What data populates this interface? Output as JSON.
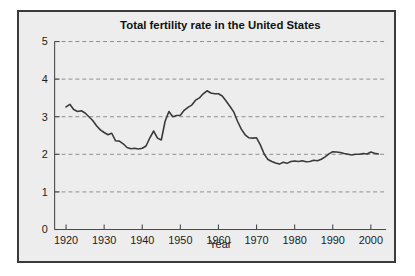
{
  "figure": {
    "background_color": "#ededed",
    "border_color": "#3b3b3b",
    "line_color": "#3a3a3a",
    "grid_color": "#8d8d8d"
  },
  "chart_data": {
    "type": "line",
    "title": "Total fertility rate in the United States",
    "xlabel": "Year",
    "ylabel": "",
    "xlim": [
      1917,
      2004
    ],
    "ylim": [
      0,
      5
    ],
    "grid": true,
    "legend": "none",
    "xticks": [
      1920,
      1930,
      1940,
      1950,
      1960,
      1970,
      1980,
      1990,
      2000
    ],
    "xtick_labels": [
      "1920",
      "1930",
      "1940",
      "1950",
      "1960",
      "1970",
      "1980",
      "1990",
      "2000"
    ],
    "yticks": [
      0,
      1,
      2,
      3,
      4,
      5
    ],
    "ytick_labels": [
      "0",
      "1",
      "2",
      "3",
      "4",
      "5"
    ],
    "series": [
      {
        "name": "Total fertility rate",
        "x": [
          1920,
          1921,
          1922,
          1923,
          1924,
          1925,
          1926,
          1927,
          1928,
          1929,
          1930,
          1931,
          1932,
          1933,
          1934,
          1935,
          1936,
          1937,
          1938,
          1939,
          1940,
          1941,
          1942,
          1943,
          1944,
          1945,
          1946,
          1947,
          1948,
          1949,
          1950,
          1951,
          1952,
          1953,
          1954,
          1955,
          1956,
          1957,
          1958,
          1959,
          1960,
          1961,
          1962,
          1963,
          1964,
          1965,
          1966,
          1967,
          1968,
          1969,
          1970,
          1971,
          1972,
          1973,
          1974,
          1975,
          1976,
          1977,
          1978,
          1979,
          1980,
          1981,
          1982,
          1983,
          1984,
          1985,
          1986,
          1987,
          1988,
          1989,
          1990,
          1991,
          1992,
          1993,
          1994,
          1995,
          1996,
          1997,
          1998,
          1999,
          2000,
          2001,
          2002
        ],
        "values": [
          3.26,
          3.33,
          3.19,
          3.14,
          3.16,
          3.1,
          3.0,
          2.9,
          2.76,
          2.65,
          2.58,
          2.52,
          2.56,
          2.36,
          2.35,
          2.28,
          2.18,
          2.15,
          2.16,
          2.14,
          2.16,
          2.22,
          2.44,
          2.62,
          2.43,
          2.38,
          2.88,
          3.14,
          3.0,
          3.03,
          3.04,
          3.17,
          3.25,
          3.31,
          3.44,
          3.5,
          3.61,
          3.69,
          3.63,
          3.61,
          3.61,
          3.55,
          3.42,
          3.28,
          3.13,
          2.88,
          2.67,
          2.52,
          2.44,
          2.43,
          2.44,
          2.25,
          2.01,
          1.86,
          1.81,
          1.77,
          1.74,
          1.79,
          1.76,
          1.81,
          1.82,
          1.81,
          1.83,
          1.8,
          1.81,
          1.84,
          1.83,
          1.87,
          1.93,
          2.01,
          2.07,
          2.06,
          2.05,
          2.02,
          2.0,
          1.98,
          2.0,
          2.0,
          2.02,
          2.01,
          2.06,
          2.03,
          2.01
        ]
      }
    ]
  }
}
